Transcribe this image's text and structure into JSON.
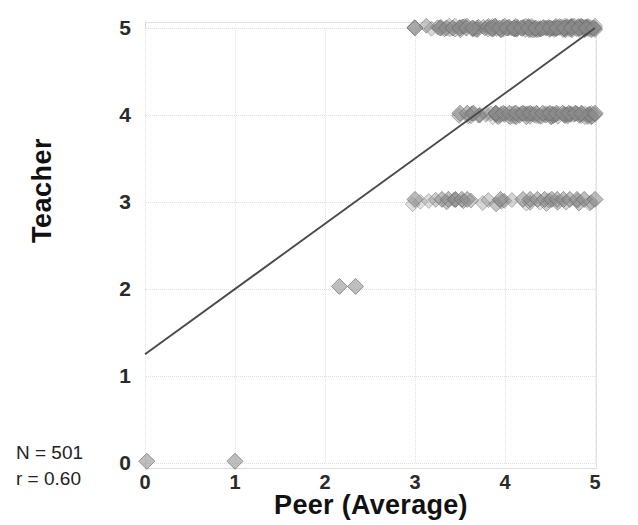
{
  "chart_data": {
    "type": "scatter",
    "title": "",
    "xlabel": "Peer (Average)",
    "ylabel": "Teacher",
    "xlim": [
      0,
      5
    ],
    "ylim": [
      0,
      5
    ],
    "xticks": [
      "0",
      "1",
      "2",
      "3",
      "4",
      "5"
    ],
    "yticks": [
      "0",
      "1",
      "2",
      "3",
      "4",
      "5"
    ],
    "grid": true,
    "legend": "none",
    "marker": "diamond",
    "marker_color": "#8c8c8c",
    "marker_opacity": 0.45,
    "jitter": true,
    "annotations": [
      "N = 501",
      "r = 0.60"
    ],
    "n": 501,
    "r": 0.6,
    "trendline": {
      "type": "linear",
      "x0": 0.0,
      "y0": 1.25,
      "x1": 5.0,
      "y1": 5.0,
      "slope": 0.75,
      "intercept": 1.25,
      "color": "#4a4a4a"
    },
    "points": [
      {
        "x": 0.02,
        "y": 0.02
      },
      {
        "x": 1.0,
        "y": 0.02
      },
      {
        "x": 2.16,
        "y": 2.03
      },
      {
        "x": 2.34,
        "y": 2.03
      },
      {
        "x": 3.0,
        "y": 3.03
      },
      {
        "x": 3.3,
        "y": 3.03
      },
      {
        "x": 3.37,
        "y": 3.03
      },
      {
        "x": 3.45,
        "y": 3.03
      },
      {
        "x": 3.52,
        "y": 3.03
      },
      {
        "x": 3.58,
        "y": 3.03
      },
      {
        "x": 3.95,
        "y": 3.03
      },
      {
        "x": 4.2,
        "y": 3.03
      },
      {
        "x": 4.28,
        "y": 3.03
      },
      {
        "x": 4.36,
        "y": 3.03
      },
      {
        "x": 4.44,
        "y": 3.03
      },
      {
        "x": 4.52,
        "y": 3.03
      },
      {
        "x": 4.58,
        "y": 3.03
      },
      {
        "x": 4.65,
        "y": 3.03
      },
      {
        "x": 4.72,
        "y": 3.03
      },
      {
        "x": 4.8,
        "y": 3.03
      },
      {
        "x": 4.88,
        "y": 3.03
      },
      {
        "x": 5.0,
        "y": 3.03
      },
      {
        "x": 3.5,
        "y": 4.02
      },
      {
        "x": 3.58,
        "y": 4.02
      },
      {
        "x": 3.65,
        "y": 4.02
      },
      {
        "x": 3.9,
        "y": 4.02
      },
      {
        "x": 3.98,
        "y": 4.02
      },
      {
        "x": 4.05,
        "y": 4.02
      },
      {
        "x": 4.12,
        "y": 4.02
      },
      {
        "x": 4.2,
        "y": 4.02
      },
      {
        "x": 4.28,
        "y": 4.02
      },
      {
        "x": 4.35,
        "y": 4.02
      },
      {
        "x": 4.42,
        "y": 4.02
      },
      {
        "x": 4.5,
        "y": 4.02
      },
      {
        "x": 4.57,
        "y": 4.02
      },
      {
        "x": 4.64,
        "y": 4.02
      },
      {
        "x": 4.71,
        "y": 4.02
      },
      {
        "x": 4.78,
        "y": 4.02
      },
      {
        "x": 4.85,
        "y": 4.02
      },
      {
        "x": 5.0,
        "y": 4.02
      },
      {
        "x": 3.0,
        "y": 5.0
      },
      {
        "x": 3.28,
        "y": 5.0
      },
      {
        "x": 3.35,
        "y": 5.0
      },
      {
        "x": 3.42,
        "y": 5.0
      },
      {
        "x": 3.5,
        "y": 5.0
      },
      {
        "x": 3.57,
        "y": 5.0
      },
      {
        "x": 3.64,
        "y": 5.0
      },
      {
        "x": 3.86,
        "y": 5.0
      },
      {
        "x": 3.94,
        "y": 5.0
      },
      {
        "x": 4.02,
        "y": 5.0
      },
      {
        "x": 4.1,
        "y": 5.0
      },
      {
        "x": 4.18,
        "y": 5.0
      },
      {
        "x": 4.26,
        "y": 5.0
      },
      {
        "x": 4.34,
        "y": 5.0
      },
      {
        "x": 4.42,
        "y": 5.0
      },
      {
        "x": 4.5,
        "y": 5.0
      },
      {
        "x": 4.58,
        "y": 5.0
      },
      {
        "x": 4.66,
        "y": 5.0
      },
      {
        "x": 4.74,
        "y": 5.0
      },
      {
        "x": 4.82,
        "y": 5.0
      },
      {
        "x": 4.9,
        "y": 5.0
      },
      {
        "x": 4.98,
        "y": 5.0
      }
    ],
    "clusters": [
      {
        "y": 0,
        "x_range": [
          0.0,
          1.0
        ],
        "density": "sparse",
        "count": 2
      },
      {
        "y": 2,
        "x_range": [
          2.15,
          2.35
        ],
        "density": "sparse",
        "count": 2
      },
      {
        "y": 3,
        "x_range": [
          3.0,
          5.0
        ],
        "density": "medium",
        "count": 40
      },
      {
        "y": 4,
        "x_range": [
          3.5,
          5.0
        ],
        "density": "high",
        "count": 120
      },
      {
        "y": 5,
        "x_range": [
          3.0,
          5.0
        ],
        "density": "very-high",
        "count": 337
      }
    ]
  }
}
